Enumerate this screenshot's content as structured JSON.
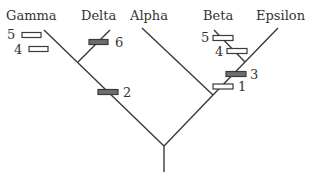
{
  "diagram": {
    "type": "phylogenetic-tree",
    "taxa": [
      {
        "label": "Gamma"
      },
      {
        "label": "Delta"
      },
      {
        "label": "Alpha"
      },
      {
        "label": "Beta"
      },
      {
        "label": "Epsilon"
      }
    ],
    "characters": [
      {
        "label": "5",
        "branch": "Gamma",
        "state": "open"
      },
      {
        "label": "4",
        "branch": "Gamma",
        "state": "open"
      },
      {
        "label": "6",
        "branch": "Delta",
        "state": "filled"
      },
      {
        "label": "2",
        "branch": "Gamma+Delta",
        "state": "filled"
      },
      {
        "label": "5",
        "branch": "Beta",
        "state": "open"
      },
      {
        "label": "4",
        "branch": "Beta",
        "state": "open"
      },
      {
        "label": "3",
        "branch": "Beta+Epsilon",
        "state": "filled"
      },
      {
        "label": "1",
        "branch": "Alpha+Beta+Epsilon",
        "state": "open"
      }
    ],
    "colors": {
      "line": "#3a3a3a",
      "filled_bar": "#6e6e6e",
      "open_bar": "#ffffff"
    }
  }
}
